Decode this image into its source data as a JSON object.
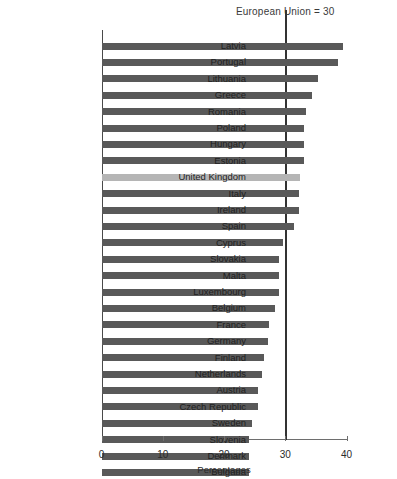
{
  "chart_data": {
    "type": "bar",
    "orientation": "horizontal",
    "title": "",
    "annotation": "European Union = 30",
    "annotation_value": 30,
    "xlabel": "Percentages",
    "ylabel": "",
    "xlim": [
      0,
      40
    ],
    "xticks": [
      0,
      10,
      20,
      30,
      40
    ],
    "xtick_labels": [
      "0",
      "10",
      "20",
      "30",
      "40"
    ],
    "grid": false,
    "legend": "none",
    "highlight_category": "United Kingdom",
    "colors": {
      "bar": "#595959",
      "highlight_bar": "#b5b5b5",
      "axis": "#4a4a4a",
      "reference_line": "#333333",
      "text": "#1f1f1f",
      "background": "#ffffff"
    },
    "categories": [
      "Latvia",
      "Portugal",
      "Lithuania",
      "Greece",
      "Romania",
      "Poland",
      "Hungary",
      "Estonia",
      "United Kingdom",
      "Italy",
      "Ireland",
      "Spain",
      "Cyprus",
      "Slovakia",
      "Malta",
      "Luxembourg",
      "Belgium",
      "France",
      "Germany",
      "Finland",
      "Netherlands",
      "Austria",
      "Czech Republic",
      "Sweden",
      "Slovenia",
      "Denmark",
      "Bulgaria"
    ],
    "values": [
      39.5,
      38.6,
      35.4,
      34.4,
      33.4,
      33.1,
      33.1,
      33.1,
      32.4,
      32.2,
      32.2,
      31.4,
      29.6,
      28.9,
      28.9,
      28.9,
      28.3,
      27.3,
      27.2,
      26.5,
      26.2,
      25.6,
      25.6,
      24.6,
      24.1,
      24.1,
      24.1
    ]
  }
}
